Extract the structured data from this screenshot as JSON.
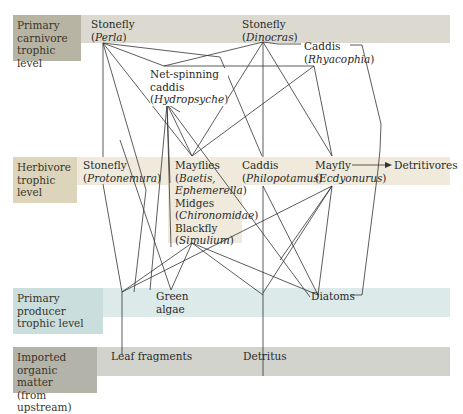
{
  "levels": {
    "carnivore": {
      "label_lines": [
        "Primary",
        "carnivore",
        "trophic level"
      ],
      "label_color": "#b8b4a4",
      "band_color": "#dcdad0"
    },
    "herbivore": {
      "label_lines": [
        "Herbivore",
        "trophic level"
      ],
      "label_color": "#dcd5bc",
      "band_color": "#efeadb"
    },
    "producer": {
      "label_lines": [
        "Primary producer",
        "trophic level"
      ],
      "label_color": "#c9dedd",
      "band_color": "#dcebea"
    },
    "imported": {
      "label_lines": [
        "Imported",
        "organic matter",
        "(from upstream)"
      ],
      "label_color": "#b3b3aa",
      "band_color": "#d3d3cd"
    }
  },
  "nodes": {
    "perla": {
      "name": "Stonefly",
      "open": "(",
      "genus": "Perla",
      "close": ")"
    },
    "dinocras": {
      "name": "Stonefly",
      "open": "(",
      "genus": "Dinocras",
      "close": ")"
    },
    "rhyacophia": {
      "name": "Caddis",
      "open": "(",
      "genus": "Rhyacophia",
      "close": ")"
    },
    "hydropsyche": {
      "name1": "Net-spinning",
      "name2": "caddis",
      "open": "(",
      "genus": "Hydropsyche",
      "close": ")"
    },
    "protonemura": {
      "name": "Stonefly",
      "open": "(",
      "genus": "Protonemura",
      "close": ")"
    },
    "mayflies": {
      "name": "Mayflies",
      "open": "(",
      "genus1": "Baetis,",
      "genus2": "Ephemerella",
      "close": ")"
    },
    "midges": {
      "name": "Midges",
      "open": "(",
      "genus": "Chironomidae",
      "close": ")"
    },
    "blackfly": {
      "name": "Blackfly",
      "open": "(",
      "genus": "Simulium",
      "close": ")"
    },
    "philopotamus": {
      "name": "Caddis",
      "open": "(",
      "genus": "Philopotamus",
      "close": ")"
    },
    "ecdyonurus": {
      "name": "Mayfly",
      "open": "(",
      "genus": "Ecdyonurus",
      "close": ")"
    },
    "detritivores": {
      "name": "Detritivores"
    },
    "green_algae": {
      "name1": "Green",
      "name2": "algae"
    },
    "diatoms": {
      "name": "Diatoms"
    },
    "leaf_fragments": {
      "name": "Leaf fragments"
    },
    "detritus": {
      "name": "Detritus"
    }
  },
  "line_color": "#333333"
}
